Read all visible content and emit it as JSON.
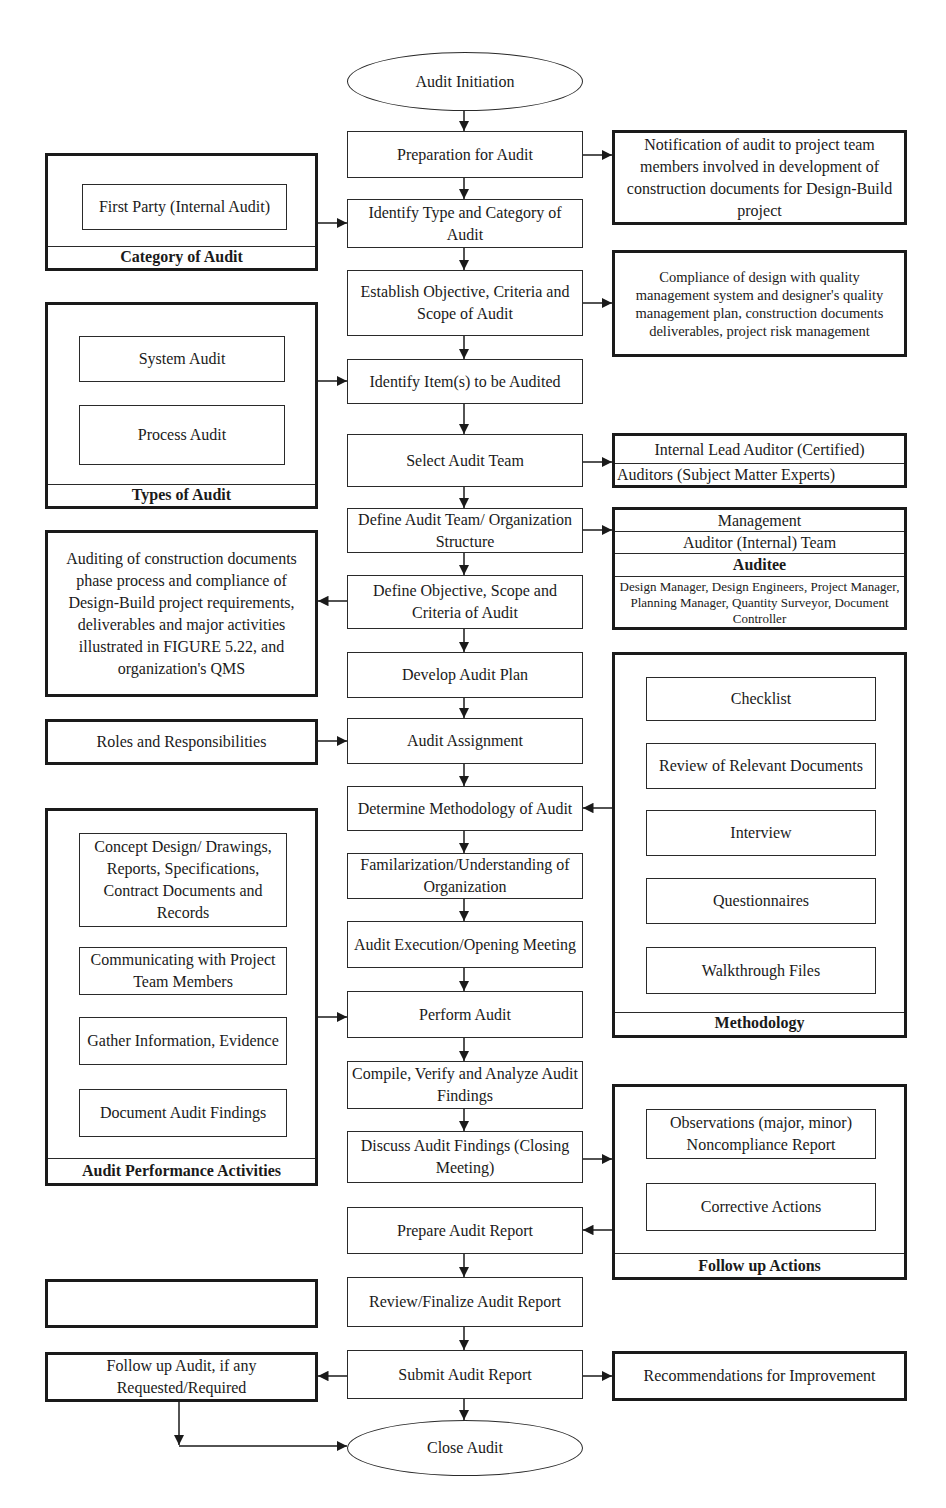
{
  "flow": {
    "start": "Audit Initiation",
    "steps": [
      "Preparation for Audit",
      "Identify Type and Category of Audit",
      "Establish Objective, Criteria and Scope of Audit",
      "Identify Item(s) to be Audited",
      "Select Audit Team",
      "Define Audit Team/ Organization Structure",
      "Define Objective, Scope and Criteria of Audit",
      "Develop Audit Plan",
      "Audit Assignment",
      "Determine Methodology of Audit",
      "Familarization/Understanding of Organization",
      "Audit Execution/Opening Meeting",
      "Perform Audit",
      "Compile, Verify and Analyze Audit Findings",
      "Discuss Audit Findings (Closing Meeting)",
      "Prepare Audit Report",
      "Review/Finalize Audit Report",
      "Submit Audit Report"
    ],
    "end": "Close Audit"
  },
  "left": {
    "category": {
      "items": [
        "First Party (Internal Audit)"
      ],
      "label": "Category of Audit"
    },
    "types": {
      "items": [
        "System Audit",
        "Process Audit"
      ],
      "label": "Types of Audit"
    },
    "scope_note": "Auditing of construction documents phase process and compliance of Design-Build project requirements, deliverables and major activities illustrated in FIGURE 5.22, and organization's QMS",
    "roles": "Roles and Responsibilities",
    "performance": {
      "items": [
        "Concept Design/ Drawings, Reports, Specifications, Contract Documents and Records",
        "Communicating with Project Team Members",
        "Gather Information, Evidence",
        "Document Audit Findings"
      ],
      "label": "Audit Performance Activities"
    },
    "empty_box": "",
    "follow_up_audit": "Follow up Audit, if any Requested/Required"
  },
  "right": {
    "notification": "Notification of audit to project team members involved in development of construction documents for Design-Build project",
    "compliance": "Compliance of design with quality management system and designer's quality management plan, construction documents deliverables, project risk management",
    "team": {
      "lead": "Internal Lead Auditor (Certified)",
      "auditors": "Auditors (Subject Matter Experts)"
    },
    "org": {
      "management": "Management",
      "auditor_team": "Auditor (Internal) Team",
      "auditee_label": "Auditee",
      "auditee_members": "Design Manager, Design Engineers, Project Manager, Planning Manager, Quantity Surveyor, Document Controller"
    },
    "methodology": {
      "items": [
        "Checklist",
        "Review of Relevant Documents",
        "Interview",
        "Questionnaires",
        "Walkthrough Files"
      ],
      "label": "Methodology"
    },
    "follow_up": {
      "items": [
        "Observations (major, minor) Noncompliance Report",
        "Corrective Actions"
      ],
      "label": "Follow up Actions"
    },
    "recommendations": "Recommendations for Improvement"
  }
}
